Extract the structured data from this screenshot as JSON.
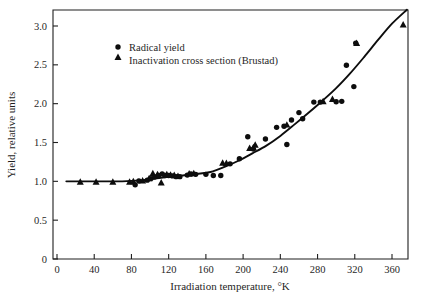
{
  "figure": {
    "background_color": "#ffffff",
    "ink_color": "#0d0d0d"
  },
  "chart_data": {
    "type": "scatter",
    "title": "",
    "subtitle": "",
    "xlabel": "Irradiation temperature,  °K",
    "ylabel": "Yield, relative units",
    "xlim": [
      0,
      380
    ],
    "ylim": [
      0,
      3.2
    ],
    "xticks": [
      0,
      40,
      80,
      120,
      160,
      200,
      240,
      280,
      320,
      360
    ],
    "xticklabels": [
      "0",
      "40",
      "80",
      "120",
      "160",
      "200",
      "240",
      "280",
      "320",
      "360"
    ],
    "yticks": [
      0,
      0.5,
      1.0,
      1.5,
      2.0,
      2.5,
      3.0
    ],
    "yticklabels": [
      "0",
      "0.5",
      "1.0",
      "1.5",
      "2.0",
      "2.5",
      "3.0"
    ],
    "grid": false,
    "legend_position": "upper left",
    "annotations": [],
    "series": [
      {
        "name": "Radical yield",
        "marker": "circle",
        "color": "#0d0d0d",
        "points": [
          [
            84,
            0.955
          ],
          [
            88,
            1.005
          ],
          [
            97,
            1.015
          ],
          [
            101,
            1.035
          ],
          [
            105,
            1.055
          ],
          [
            109,
            1.075
          ],
          [
            113,
            1.095
          ],
          [
            116,
            1.075
          ],
          [
            120,
            1.075
          ],
          [
            124,
            1.07
          ],
          [
            128,
            1.06
          ],
          [
            132,
            1.06
          ],
          [
            140,
            1.08
          ],
          [
            144,
            1.095
          ],
          [
            149,
            1.09
          ],
          [
            160,
            1.09
          ],
          [
            168,
            1.075
          ],
          [
            176,
            1.075
          ],
          [
            186,
            1.225
          ],
          [
            196,
            1.29
          ],
          [
            205,
            1.575
          ],
          [
            211,
            1.415
          ],
          [
            224,
            1.545
          ],
          [
            236,
            1.695
          ],
          [
            244,
            1.71
          ],
          [
            247,
            1.475
          ],
          [
            252,
            1.79
          ],
          [
            260,
            1.885
          ],
          [
            264,
            1.805
          ],
          [
            276,
            2.02
          ],
          [
            283,
            2.02
          ],
          [
            300,
            2.025
          ],
          [
            306,
            2.03
          ],
          [
            311,
            2.495
          ],
          [
            319,
            2.22
          ],
          [
            321,
            2.78
          ]
        ]
      },
      {
        "name": "Inactivation cross section (Brustad)",
        "marker": "triangle",
        "color": "#0d0d0d",
        "points": [
          [
            25,
            0.995
          ],
          [
            42,
            0.995
          ],
          [
            60,
            0.995
          ],
          [
            78,
            0.995
          ],
          [
            82,
            1.0
          ],
          [
            92,
            1.01
          ],
          [
            99,
            1.04
          ],
          [
            103,
            1.105
          ],
          [
            108,
            1.09
          ],
          [
            112,
            0.985
          ],
          [
            118,
            1.09
          ],
          [
            122,
            1.085
          ],
          [
            126,
            1.08
          ],
          [
            130,
            1.07
          ],
          [
            142,
            1.1
          ],
          [
            147,
            1.105
          ],
          [
            178,
            1.24
          ],
          [
            182,
            1.235
          ],
          [
            207,
            1.43
          ],
          [
            211,
            1.44
          ],
          [
            213,
            1.47
          ],
          [
            247,
            1.73
          ],
          [
            286,
            2.03
          ],
          [
            296,
            2.06
          ],
          [
            322,
            2.78
          ],
          [
            372,
            3.02
          ]
        ]
      }
    ],
    "fit_curve": {
      "name": "fitted trend line",
      "points": [
        [
          10,
          1.0
        ],
        [
          40,
          1.0
        ],
        [
          70,
          1.0
        ],
        [
          90,
          1.012
        ],
        [
          105,
          1.035
        ],
        [
          120,
          1.058
        ],
        [
          135,
          1.075
        ],
        [
          150,
          1.095
        ],
        [
          165,
          1.12
        ],
        [
          180,
          1.185
        ],
        [
          195,
          1.265
        ],
        [
          210,
          1.36
        ],
        [
          225,
          1.46
        ],
        [
          240,
          1.585
        ],
        [
          255,
          1.73
        ],
        [
          270,
          1.88
        ],
        [
          285,
          2.035
        ],
        [
          300,
          2.2
        ],
        [
          315,
          2.39
        ],
        [
          330,
          2.6
        ],
        [
          345,
          2.82
        ],
        [
          360,
          3.03
        ],
        [
          376,
          3.21
        ]
      ]
    }
  },
  "legend": {
    "entries": [
      {
        "label": "Radical yield",
        "marker": "circle"
      },
      {
        "label": "Inactivation cross section (Brustad)",
        "marker": "triangle"
      }
    ]
  }
}
